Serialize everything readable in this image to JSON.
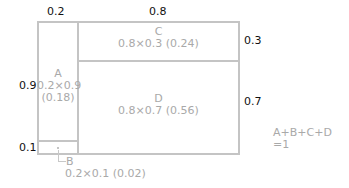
{
  "diagram": {
    "top_dimensions": [
      "0.2",
      "0.8"
    ],
    "left_dimensions": [
      "0.9",
      "0.1"
    ],
    "right_dimensions": [
      "0.3",
      "0.7"
    ],
    "regions": [
      {
        "name": "A",
        "formula": "0.2×0.9",
        "area": "(0.18)"
      },
      {
        "name": "B",
        "formula": "0.2×0.1 (0.02)"
      },
      {
        "name": "C",
        "formula": "0.8×0.3 (0.24)"
      },
      {
        "name": "D",
        "formula": "0.8×0.7 (0.56)"
      }
    ],
    "sum_line1": "A+B+C+D",
    "sum_line2": "=1"
  },
  "colors": {
    "box_line": "#c4c4c4",
    "label": "#a9a9a9",
    "dimension": "#111111"
  }
}
